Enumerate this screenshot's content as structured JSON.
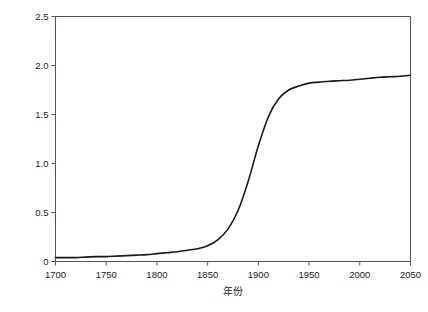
{
  "chart_data": {
    "type": "line",
    "title": "",
    "xlabel": "年份",
    "ylabel": "美国耕地面积（亿公顷）",
    "xlim": [
      1700,
      2050
    ],
    "ylim": [
      0,
      2.5
    ],
    "xticks": [
      1700,
      1750,
      1800,
      1850,
      1900,
      1950,
      2000,
      2050
    ],
    "xtick_labels": [
      "1700",
      "1750",
      "1800",
      "1850",
      "1900",
      "1950",
      "2000",
      "2050"
    ],
    "yticks": [
      0,
      0.5,
      1.0,
      1.5,
      2.0,
      2.5
    ],
    "ytick_labels": [
      "0",
      "0.5",
      "1.0",
      "1.5",
      "2.0",
      "2.5"
    ],
    "grid": false,
    "legend": false,
    "line_color": "#1a1a1a",
    "line_width": 1.6,
    "series": [
      {
        "name": "美国耕地面积",
        "x": [
          1700,
          1710,
          1720,
          1730,
          1740,
          1750,
          1760,
          1770,
          1780,
          1790,
          1800,
          1810,
          1820,
          1830,
          1840,
          1850,
          1860,
          1870,
          1880,
          1890,
          1900,
          1910,
          1920,
          1930,
          1940,
          1950,
          1960,
          1970,
          1980,
          1990,
          2000,
          2010,
          2020,
          2030,
          2040,
          2050
        ],
        "values": [
          0.04,
          0.04,
          0.04,
          0.045,
          0.05,
          0.05,
          0.055,
          0.06,
          0.065,
          0.07,
          0.08,
          0.09,
          0.1,
          0.115,
          0.13,
          0.16,
          0.22,
          0.33,
          0.52,
          0.82,
          1.18,
          1.48,
          1.66,
          1.75,
          1.79,
          1.82,
          1.83,
          1.84,
          1.845,
          1.85,
          1.86,
          1.87,
          1.88,
          1.885,
          1.89,
          1.9
        ]
      }
    ]
  }
}
